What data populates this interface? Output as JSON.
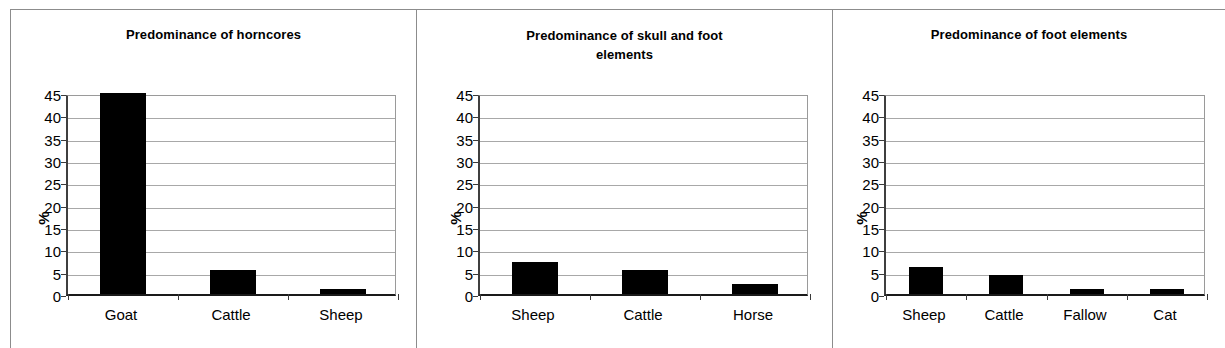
{
  "figure": {
    "panel_count": 3,
    "axis_ticks": [
      0,
      5,
      10,
      15,
      20,
      25,
      30,
      35,
      40,
      45
    ],
    "y_axis_label": "%",
    "gridline_color": "#a8a8a8",
    "bar_color": "#000000",
    "axis_color": "#1a1a1a"
  },
  "chart_data": [
    {
      "type": "bar",
      "title": "Predominance of horncores",
      "categories": [
        "Goat",
        "Cattle",
        "Sheep"
      ],
      "values": [
        45.0,
        5.3,
        1.2
      ],
      "xlabel": "",
      "ylabel": "%",
      "ylim": [
        0,
        45
      ],
      "yticks": [
        0,
        5,
        10,
        15,
        20,
        25,
        30,
        35,
        40,
        45
      ],
      "grid": true,
      "legend": null
    },
    {
      "type": "bar",
      "title": "Predominance of skull and foot elements",
      "title_lines": [
        "Predominance of skull and foot",
        "elements"
      ],
      "categories": [
        "Sheep",
        "Cattle",
        "Horse"
      ],
      "values": [
        7.2,
        5.3,
        2.3
      ],
      "xlabel": "",
      "ylabel": "%",
      "ylim": [
        0,
        45
      ],
      "yticks": [
        0,
        5,
        10,
        15,
        20,
        25,
        30,
        35,
        40,
        45
      ],
      "grid": true,
      "legend": null
    },
    {
      "type": "bar",
      "title": "Predominance of foot elements",
      "categories": [
        "Sheep",
        "Cattle",
        "Fallow",
        "Cat"
      ],
      "values": [
        6.1,
        4.2,
        1.1,
        1.1
      ],
      "xlabel": "",
      "ylabel": "%",
      "ylim": [
        0,
        45
      ],
      "yticks": [
        0,
        5,
        10,
        15,
        20,
        25,
        30,
        35,
        40,
        45
      ],
      "grid": true,
      "legend": null
    }
  ]
}
